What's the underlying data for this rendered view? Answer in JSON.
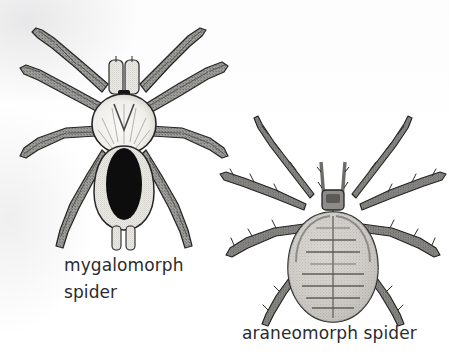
{
  "figure": {
    "background_color": "#fdfdfd",
    "ink_color": "#2b2b2b",
    "type": "scanned-line-drawing"
  },
  "illustrations": [
    {
      "id": "mygalomorph",
      "name": "mygalomorph-spider-illustration",
      "description": "dorsal view line drawing of a stout hairy tarantula-like spider with eight thick segmented legs, pale round cephalothorax and a black oval abdomen marking",
      "position": {
        "left": 14,
        "top": 14,
        "width": 210,
        "height": 240
      },
      "body": {
        "cephalothorax_fill": "#f4f2ee",
        "abdomen_fill": "#f0eeea",
        "abdomen_marking_fill": "#0d0d0d",
        "leg_fill": "#9a9a97",
        "outline": "#262626",
        "leg_count": 8,
        "pedipalp_count": 2,
        "spinneret_count": 2
      }
    },
    {
      "id": "araneomorph",
      "name": "araneomorph-spider-illustration",
      "description": "dorsal view line drawing of a slender spiny-legged spider with a small dark cephalothorax and a large egg-shaped stippled abdomen bearing a midline and chevron segment bands",
      "position": {
        "left": 222,
        "top": 120,
        "width": 222,
        "height": 205
      },
      "body": {
        "cephalothorax_fill": "#8e8e8b",
        "abdomen_fill": "#c9c7c2",
        "abdomen_marking_fill": "#6e6c68",
        "leg_fill": "#7c7c79",
        "outline": "#242424",
        "leg_count": 8,
        "pedipalp_count": 2
      }
    }
  ],
  "captions": {
    "mygalomorph": {
      "name": "mygalomorph-spider-caption",
      "line1": "mygalomorph",
      "line2": "spider",
      "full_text": "mygalomorph spider"
    },
    "araneomorph": {
      "name": "araneomorph-spider-caption",
      "line1": "araneomorph spider",
      "full_text": "araneomorph spider"
    }
  }
}
